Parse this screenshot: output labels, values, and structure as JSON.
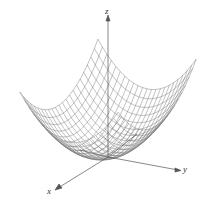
{
  "figure": {
    "axes": {
      "x_label": "x",
      "y_label": "y",
      "z_label": "z"
    },
    "colors": {
      "mesh": "#666666",
      "axis": "#555555",
      "background": "#ffffff"
    }
  }
}
